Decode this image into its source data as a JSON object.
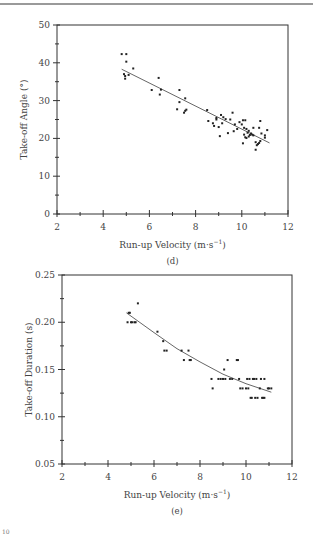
{
  "chart_data": [
    {
      "type": "scatter",
      "panel": "(d)",
      "title": "",
      "xlabel": "Run-up Velocity (m·s⁻¹)",
      "ylabel": "Take-off Angle (°)",
      "xlim": [
        2,
        12
      ],
      "ylim": [
        0,
        50
      ],
      "x_ticks": [
        2,
        4,
        6,
        8,
        10,
        12
      ],
      "y_ticks": [
        0,
        10,
        20,
        30,
        40,
        50
      ],
      "grid": false,
      "legend": null,
      "fit": {
        "kind": "linear",
        "x": [
          4.8,
          11.2
        ],
        "y": [
          38.3,
          18.8
        ]
      },
      "points": [
        [
          4.8,
          42.3
        ],
        [
          5.0,
          42.3
        ],
        [
          5.0,
          40.3
        ],
        [
          4.9,
          37.0
        ],
        [
          4.95,
          36.5
        ],
        [
          4.95,
          35.8
        ],
        [
          5.1,
          36.8
        ],
        [
          5.3,
          38.5
        ],
        [
          6.1,
          32.8
        ],
        [
          6.4,
          36.0
        ],
        [
          6.45,
          31.6
        ],
        [
          6.5,
          32.9
        ],
        [
          7.2,
          27.7
        ],
        [
          7.3,
          32.8
        ],
        [
          7.3,
          29.6
        ],
        [
          7.5,
          26.8
        ],
        [
          7.55,
          30.6
        ],
        [
          7.6,
          27.6
        ],
        [
          7.55,
          27.3
        ],
        [
          8.5,
          27.5
        ],
        [
          8.55,
          24.6
        ],
        [
          8.75,
          24.0
        ],
        [
          8.8,
          23.3
        ],
        [
          8.9,
          25.4
        ],
        [
          8.9,
          25.0
        ],
        [
          9.0,
          23.0
        ],
        [
          9.05,
          20.6
        ],
        [
          9.1,
          26.2
        ],
        [
          9.15,
          24.0
        ],
        [
          9.2,
          25.6
        ],
        [
          9.3,
          25.1
        ],
        [
          9.4,
          21.4
        ],
        [
          9.5,
          25.0
        ],
        [
          9.6,
          26.8
        ],
        [
          9.65,
          21.9
        ],
        [
          9.7,
          23.7
        ],
        [
          9.8,
          22.5
        ],
        [
          9.9,
          24.3
        ],
        [
          10.0,
          23.7
        ],
        [
          10.05,
          24.8
        ],
        [
          10.05,
          18.7
        ],
        [
          10.1,
          21.0
        ],
        [
          10.1,
          22.8
        ],
        [
          10.15,
          24.8
        ],
        [
          10.15,
          20.3
        ],
        [
          10.2,
          22.5
        ],
        [
          10.2,
          20.1
        ],
        [
          10.25,
          21.5
        ],
        [
          10.3,
          22.0
        ],
        [
          10.3,
          20.5
        ],
        [
          10.35,
          20.9
        ],
        [
          10.4,
          21.3
        ],
        [
          10.45,
          21.0
        ],
        [
          10.5,
          22.8
        ],
        [
          10.5,
          20.8
        ],
        [
          10.6,
          19.0
        ],
        [
          10.6,
          17.0
        ],
        [
          10.65,
          18.2
        ],
        [
          10.7,
          18.5
        ],
        [
          10.75,
          22.8
        ],
        [
          10.75,
          18.8
        ],
        [
          10.8,
          19.3
        ],
        [
          10.8,
          24.6
        ],
        [
          10.85,
          21.3
        ],
        [
          11.0,
          20.2
        ],
        [
          11.0,
          20.8
        ],
        [
          11.1,
          22.2
        ]
      ]
    },
    {
      "type": "scatter",
      "panel": "(e)",
      "title": "",
      "xlabel": "Run-up Velocity (m·s⁻¹)",
      "ylabel": "Take-off Duration (s)",
      "xlim": [
        2,
        12
      ],
      "ylim": [
        0.05,
        0.25
      ],
      "x_ticks": [
        2,
        4,
        6,
        8,
        10,
        12
      ],
      "y_ticks": [
        0.05,
        0.1,
        0.15,
        0.2,
        0.25
      ],
      "grid": false,
      "legend": null,
      "fit": {
        "kind": "polynomial (quadratic)",
        "x": [
          4.8,
          6.0,
          7.0,
          8.0,
          9.0,
          10.0,
          11.1
        ],
        "y": [
          0.21,
          0.189,
          0.172,
          0.158,
          0.145,
          0.135,
          0.126
        ]
      },
      "points": [
        [
          4.85,
          0.2
        ],
        [
          4.9,
          0.21
        ],
        [
          4.95,
          0.21
        ],
        [
          5.0,
          0.2
        ],
        [
          5.05,
          0.2
        ],
        [
          5.15,
          0.2
        ],
        [
          5.2,
          0.2
        ],
        [
          5.3,
          0.22
        ],
        [
          6.15,
          0.19
        ],
        [
          6.4,
          0.18
        ],
        [
          6.45,
          0.17
        ],
        [
          6.55,
          0.17
        ],
        [
          7.2,
          0.17
        ],
        [
          7.3,
          0.16
        ],
        [
          7.5,
          0.17
        ],
        [
          7.55,
          0.16
        ],
        [
          7.6,
          0.16
        ],
        [
          8.5,
          0.14
        ],
        [
          8.55,
          0.13
        ],
        [
          8.8,
          0.14
        ],
        [
          8.9,
          0.14
        ],
        [
          9.0,
          0.14
        ],
        [
          9.05,
          0.15
        ],
        [
          9.1,
          0.14
        ],
        [
          9.2,
          0.16
        ],
        [
          9.3,
          0.14
        ],
        [
          9.4,
          0.14
        ],
        [
          9.6,
          0.16
        ],
        [
          9.65,
          0.16
        ],
        [
          9.7,
          0.14
        ],
        [
          9.75,
          0.13
        ],
        [
          9.85,
          0.13
        ],
        [
          10.0,
          0.13
        ],
        [
          10.05,
          0.14
        ],
        [
          10.1,
          0.13
        ],
        [
          10.15,
          0.14
        ],
        [
          10.2,
          0.12
        ],
        [
          10.25,
          0.12
        ],
        [
          10.3,
          0.14
        ],
        [
          10.35,
          0.14
        ],
        [
          10.4,
          0.12
        ],
        [
          10.45,
          0.14
        ],
        [
          10.5,
          0.12
        ],
        [
          10.6,
          0.13
        ],
        [
          10.65,
          0.14
        ],
        [
          10.7,
          0.12
        ],
        [
          10.75,
          0.12
        ],
        [
          10.8,
          0.14
        ],
        [
          10.8,
          0.12
        ],
        [
          10.95,
          0.13
        ],
        [
          11.0,
          0.13
        ],
        [
          11.1,
          0.13
        ]
      ]
    }
  ],
  "captions": {
    "d": "(d)",
    "e": "(e)"
  },
  "footer_mark": "10"
}
